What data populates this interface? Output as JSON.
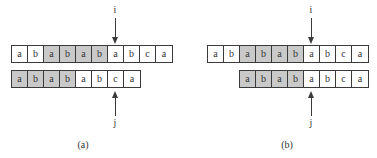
{
  "colors": {
    "shaded": "#c9c9c9",
    "border": "#3a3a3a",
    "background": "#ffffff"
  },
  "panels": [
    {
      "caption": "(a)",
      "text": {
        "cells": [
          "a",
          "b",
          "a",
          "b",
          "a",
          "b",
          "a",
          "b",
          "c",
          "a"
        ],
        "shaded": [
          false,
          false,
          true,
          true,
          true,
          true,
          false,
          false,
          false,
          false
        ]
      },
      "pattern": {
        "offset_cells": 0,
        "cells": [
          "a",
          "b",
          "a",
          "b",
          "a",
          "b",
          "c",
          "a"
        ],
        "shaded": [
          true,
          true,
          true,
          true,
          false,
          false,
          false,
          false
        ]
      },
      "pointer_i": {
        "label": "i",
        "index": 6
      },
      "pointer_j": {
        "label": "j",
        "index": 6
      }
    },
    {
      "caption": "(b)",
      "text": {
        "cells": [
          "a",
          "b",
          "a",
          "b",
          "a",
          "b",
          "a",
          "b",
          "c",
          "a"
        ],
        "shaded": [
          false,
          false,
          true,
          true,
          true,
          true,
          false,
          false,
          false,
          false
        ]
      },
      "pattern": {
        "offset_cells": 2,
        "cells": [
          "a",
          "b",
          "a",
          "b",
          "a",
          "b",
          "c",
          "a"
        ],
        "shaded": [
          true,
          true,
          true,
          true,
          false,
          false,
          false,
          false
        ]
      },
      "pointer_i": {
        "label": "i",
        "index": 6
      },
      "pointer_j": {
        "label": "j",
        "index": 4
      }
    }
  ]
}
